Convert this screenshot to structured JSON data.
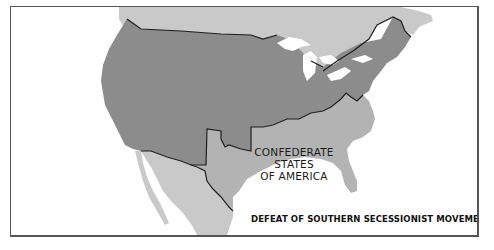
{
  "map": {
    "caption": "DEFEAT OF SOUTHERN SECESSIONIST MOVEMENT, 1861-1865",
    "regions": [
      {
        "name": "Union (United States)",
        "color": "#8c8c8c"
      },
      {
        "name": "Confederate States of America",
        "color": "#b3b3b3"
      },
      {
        "name": "Canada / Mexico (foreign territory)",
        "color": "#c9c9c9"
      },
      {
        "name": "Water / Great Lakes / Ocean",
        "color": "#ffffff"
      }
    ],
    "labels": {
      "confederacy_line1": "CONFEDERATE STATES",
      "confederacy_line2": "OF AMERICA"
    }
  }
}
